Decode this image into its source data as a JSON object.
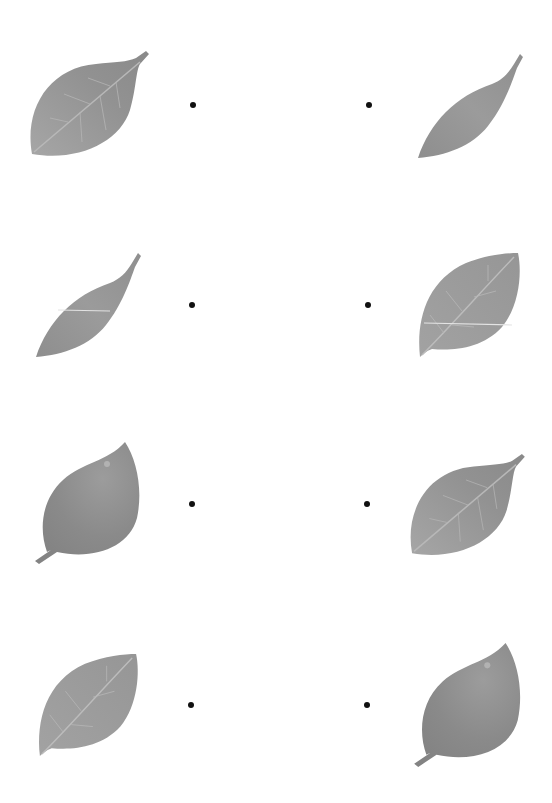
{
  "worksheet": {
    "type": "leaf-matching",
    "colors": {
      "background": "#ffffff",
      "dot": "#111111",
      "leaf_light": "#a3a3a3",
      "leaf_mid": "#919191",
      "leaf_dark": "#7f7f7f",
      "vein": "#c4c4c4"
    },
    "rows": [
      {
        "left": {
          "leaf": "broad-veined-leaf",
          "icon": "leaf-icon"
        },
        "right": {
          "leaf": "narrow-lanceolate-leaf",
          "icon": "leaf-icon"
        }
      },
      {
        "left": {
          "leaf": "narrow-lanceolate-leaf",
          "icon": "leaf-icon"
        },
        "right": {
          "leaf": "oval-veined-leaf",
          "icon": "leaf-icon"
        }
      },
      {
        "left": {
          "leaf": "glossy-stemmed-leaf",
          "icon": "leaf-icon"
        },
        "right": {
          "leaf": "broad-veined-leaf",
          "icon": "leaf-icon"
        }
      },
      {
        "left": {
          "leaf": "oval-veined-leaf",
          "icon": "leaf-icon"
        },
        "right": {
          "leaf": "glossy-stemmed-leaf",
          "icon": "leaf-icon"
        }
      }
    ]
  }
}
